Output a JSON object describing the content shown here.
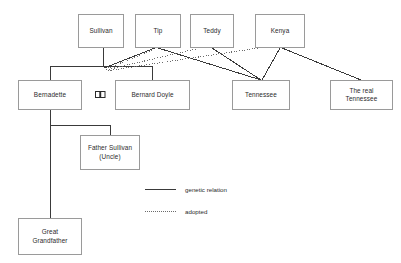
{
  "diagram": {
    "type": "genealogy-tree",
    "colors": {
      "box_border": "#9a9a9a",
      "genetic_line": "#3a3a3a",
      "adopted_line": "#6b6b6b",
      "text": "#2b2b2b",
      "background": "#ffffff"
    },
    "nodes": [
      {
        "id": "sullivan",
        "label": "Sullivan",
        "x": 78,
        "y": 14,
        "w": 46,
        "h": 34
      },
      {
        "id": "tip",
        "label": "Tip",
        "x": 135,
        "y": 14,
        "w": 46,
        "h": 34
      },
      {
        "id": "teddy",
        "label": "Teddy",
        "x": 190,
        "y": 14,
        "w": 44,
        "h": 34
      },
      {
        "id": "kenya",
        "label": "Kenya",
        "x": 255,
        "y": 14,
        "w": 50,
        "h": 34
      },
      {
        "id": "bernadette",
        "label": "Bernadette",
        "x": 18,
        "y": 80,
        "w": 64,
        "h": 30
      },
      {
        "id": "bernard-doyle",
        "label": "Bernard Doyle",
        "x": 115,
        "y": 80,
        "w": 75,
        "h": 30
      },
      {
        "id": "tennessee",
        "label": "Tennessee",
        "x": 232,
        "y": 80,
        "w": 58,
        "h": 30
      },
      {
        "id": "real-tennessee",
        "label": "The real\nTennessee",
        "x": 330,
        "y": 80,
        "w": 63,
        "h": 30
      },
      {
        "id": "father-sullivan",
        "label": "Father Sullivan\n(Uncle)",
        "x": 80,
        "y": 135,
        "w": 60,
        "h": 35
      },
      {
        "id": "great-grandfather",
        "label": "Great\nGrandfather",
        "x": 18,
        "y": 218,
        "w": 64,
        "h": 37
      }
    ],
    "marriage_symbol": {
      "id": "marriage-link",
      "x": 95,
      "y": 91
    },
    "legend": {
      "items": [
        {
          "id": "genetic",
          "style": "solid",
          "label": "genetic relation"
        },
        {
          "id": "adopted",
          "style": "dotted",
          "label": "adopted"
        }
      ],
      "x": 145,
      "y": 184
    },
    "edges": [
      {
        "id": "sullivan-to-junction",
        "style": "solid",
        "points": "103,48 103,66"
      },
      {
        "id": "bernadette-bernard-bar",
        "style": "solid",
        "points": "50,66 152,66"
      },
      {
        "id": "bar-to-bernadette",
        "style": "solid",
        "points": "50,66 50,80"
      },
      {
        "id": "bar-to-bernard-doyle",
        "style": "solid",
        "points": "152,66 152,80"
      },
      {
        "id": "tip-to-junction",
        "style": "solid",
        "points": "155,48 104,68"
      },
      {
        "id": "tip-to-tennessee",
        "style": "solid",
        "points": "158,48 261,80"
      },
      {
        "id": "teddy-to-tennessee",
        "style": "solid",
        "points": "212,48 261,80"
      },
      {
        "id": "kenya-to-tennessee",
        "style": "solid",
        "points": "280,48 262,80"
      },
      {
        "id": "kenya-to-real-tennessee",
        "style": "solid",
        "points": "282,48 361,80"
      },
      {
        "id": "tip-adopted-to-junction",
        "style": "dotted",
        "points": "152,50 106,69"
      },
      {
        "id": "teddy-adopted-to-junction",
        "style": "dotted",
        "points": "196,49 106,70"
      },
      {
        "id": "kenya-adopted-to-junction",
        "style": "dotted",
        "points": "258,48 106,71"
      },
      {
        "id": "bernadette-child-stem",
        "style": "solid",
        "points": "50,110 50,218"
      },
      {
        "id": "bernadette-uncle-bar",
        "style": "solid",
        "points": "50,125 110,125"
      },
      {
        "id": "uncle-bar-drop",
        "style": "solid",
        "points": "110,125 110,135"
      }
    ]
  }
}
